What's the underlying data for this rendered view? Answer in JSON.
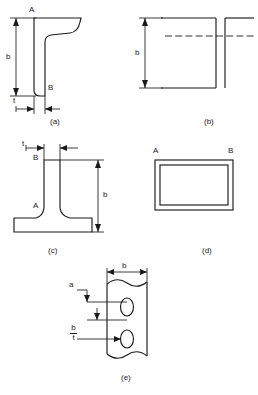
{
  "figure": {
    "title": "",
    "line_color": "#1a1a1a",
    "background_color": "#ffffff",
    "panels": [
      {
        "id": "a",
        "caption": "(a)",
        "shape": "lipped-angle-section",
        "labels": [
          {
            "name": "point-label-a",
            "text": "A"
          },
          {
            "name": "point-label-b",
            "text": "B"
          },
          {
            "name": "dimension-b",
            "text": "b"
          },
          {
            "name": "dimension-t",
            "text": "t"
          }
        ]
      },
      {
        "id": "b",
        "caption": "(b)",
        "shape": "double-angle-back-to-back",
        "labels": [
          {
            "name": "dimension-b",
            "text": "b"
          }
        ]
      },
      {
        "id": "c",
        "caption": "(c)",
        "shape": "tee-section",
        "labels": [
          {
            "name": "point-label-a",
            "text": "A"
          },
          {
            "name": "point-label-b",
            "text": "B"
          },
          {
            "name": "dimension-b",
            "text": "b"
          },
          {
            "name": "dimension-t",
            "text": "t"
          }
        ]
      },
      {
        "id": "d",
        "caption": "(d)",
        "shape": "rectangular-hollow-section",
        "labels": [
          {
            "name": "point-label-a",
            "text": "A"
          },
          {
            "name": "point-label-b",
            "text": "B"
          }
        ]
      },
      {
        "id": "e",
        "caption": "(e)",
        "shape": "perforated-plate-with-slotted-holes",
        "labels": [
          {
            "name": "dimension-b-top",
            "text": "b"
          },
          {
            "name": "dimension-a",
            "text": "a"
          },
          {
            "name": "ratio-numerator",
            "text": "b"
          },
          {
            "name": "ratio-denominator",
            "text": "t"
          }
        ]
      }
    ]
  },
  "footer": {
    "text": ""
  }
}
